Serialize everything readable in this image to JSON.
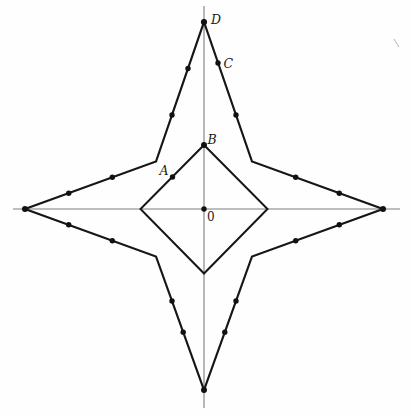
{
  "figure": {
    "canvas": {
      "width": 412,
      "height": 418,
      "background": "#fefefe"
    },
    "colors": {
      "shape_stroke": "#161616",
      "axis_stroke": "#7d7d7d",
      "dot_fill": "#111111",
      "label_color": "#1a1a1a",
      "artifact_color": "#b4b4b4"
    },
    "axes": {
      "horizontal": {
        "x1": 13,
        "y1": 209,
        "x2": 400,
        "y2": 209,
        "width": 1.1
      },
      "vertical": {
        "x1": 204,
        "y1": 6,
        "x2": 204,
        "y2": 408,
        "width": 1.1
      }
    },
    "polygons": [
      {
        "name": "star-outline",
        "stroke_width": 2.2,
        "points": [
          [
            204,
            22
          ],
          [
            252,
            161.5
          ],
          [
            383,
            209
          ],
          [
            252,
            256.5
          ],
          [
            204,
            390
          ],
          [
            156,
            256.5
          ],
          [
            25,
            209
          ],
          [
            156,
            161.5
          ]
        ]
      },
      {
        "name": "inner-diamond",
        "stroke_width": 2.0,
        "points": [
          [
            204,
            145
          ],
          [
            267.5,
            209
          ],
          [
            204,
            273.5
          ],
          [
            140.5,
            209
          ]
        ]
      }
    ],
    "dots": [
      {
        "name": "star-top-point-D",
        "x": 204,
        "y": 22,
        "r": 3.1
      },
      {
        "name": "star-right-point",
        "x": 383,
        "y": 209,
        "r": 3.0
      },
      {
        "name": "star-bottom-point",
        "x": 204,
        "y": 390,
        "r": 3.0
      },
      {
        "name": "star-left-point",
        "x": 25,
        "y": 209,
        "r": 3.0
      },
      {
        "name": "diamond-top-vertex-B",
        "x": 204,
        "y": 145,
        "r": 3.0
      },
      {
        "name": "center-O",
        "x": 204,
        "y": 209,
        "r": 2.7
      },
      {
        "name": "point-A",
        "x": 172.5,
        "y": 177,
        "r": 2.7
      },
      {
        "name": "edge-dot",
        "x": 188,
        "y": 68.5,
        "r": 2.7
      },
      {
        "name": "edge-dot",
        "x": 172,
        "y": 115,
        "r": 2.7
      },
      {
        "name": "edge-dot-C",
        "x": 218,
        "y": 63,
        "r": 2.7
      },
      {
        "name": "edge-dot",
        "x": 236,
        "y": 115,
        "r": 2.7
      },
      {
        "name": "edge-dot",
        "x": 68.7,
        "y": 193.2,
        "r": 2.7
      },
      {
        "name": "edge-dot",
        "x": 112.3,
        "y": 177.3,
        "r": 2.7
      },
      {
        "name": "edge-dot",
        "x": 68.7,
        "y": 224.8,
        "r": 2.7
      },
      {
        "name": "edge-dot",
        "x": 112.3,
        "y": 240.7,
        "r": 2.7
      },
      {
        "name": "edge-dot",
        "x": 339.3,
        "y": 193.2,
        "r": 2.7
      },
      {
        "name": "edge-dot",
        "x": 295.7,
        "y": 177.3,
        "r": 2.7
      },
      {
        "name": "edge-dot",
        "x": 339.3,
        "y": 224.8,
        "r": 2.7
      },
      {
        "name": "edge-dot",
        "x": 295.7,
        "y": 240.7,
        "r": 2.7
      },
      {
        "name": "edge-dot",
        "x": 172,
        "y": 301,
        "r": 2.7
      },
      {
        "name": "edge-dot",
        "x": 183.2,
        "y": 332.3,
        "r": 2.7
      },
      {
        "name": "edge-dot",
        "x": 236,
        "y": 301,
        "r": 2.7
      },
      {
        "name": "edge-dot",
        "x": 224.8,
        "y": 332.3,
        "r": 2.7
      }
    ],
    "labels": [
      {
        "text": "D",
        "x": 211,
        "y": 24,
        "italic": true,
        "size": 12.5
      },
      {
        "text": "C",
        "x": 223.5,
        "y": 68,
        "italic": true,
        "size": 12.5
      },
      {
        "text": "B",
        "x": 207.5,
        "y": 143.5,
        "italic": true,
        "size": 12.5
      },
      {
        "text": "A",
        "x": 159.5,
        "y": 175,
        "italic": true,
        "size": 12.5
      },
      {
        "text": "0",
        "x": 207,
        "y": 220.5,
        "italic": false,
        "size": 12
      }
    ],
    "artifact_tick": {
      "x1": 394,
      "y1": 39,
      "x2": 399,
      "y2": 47,
      "width": 1
    }
  }
}
